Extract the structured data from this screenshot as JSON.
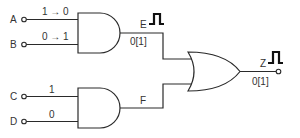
{
  "diagram": {
    "type": "logic-circuit",
    "inputs": [
      {
        "name": "A",
        "value": "1 → 0"
      },
      {
        "name": "B",
        "value": "0 → 1"
      },
      {
        "name": "C",
        "value": "1"
      },
      {
        "name": "D",
        "value": "0"
      }
    ],
    "gates": [
      {
        "id": "and1",
        "type": "AND",
        "inputs": [
          "A",
          "B"
        ],
        "output": "E"
      },
      {
        "id": "and2",
        "type": "AND",
        "inputs": [
          "C",
          "D"
        ],
        "output": "F"
      },
      {
        "id": "or1",
        "type": "OR",
        "inputs": [
          "E",
          "F"
        ],
        "output": "Z"
      }
    ],
    "signals": {
      "E": {
        "label": "E",
        "value": "0[1]",
        "glitch_icon": "pulse-icon"
      },
      "F": {
        "label": "F"
      },
      "Z": {
        "label": "Z",
        "value": "0[1]",
        "glitch_icon": "pulse-icon"
      }
    }
  }
}
